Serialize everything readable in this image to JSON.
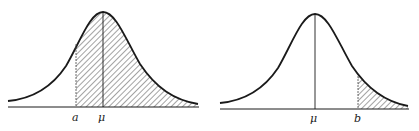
{
  "figures": [
    {
      "id": "left",
      "description": "Normal curve with shaded area from a to right tail",
      "labels": {
        "a": "a",
        "mu": "μ"
      }
    },
    {
      "id": "right",
      "description": "Normal curve with shaded right tail beyond b",
      "labels": {
        "mu": "μ",
        "b": "b"
      }
    }
  ],
  "colors": {
    "line": "#1a1a1a",
    "hatch": "#333333",
    "background": "#ffffff"
  }
}
